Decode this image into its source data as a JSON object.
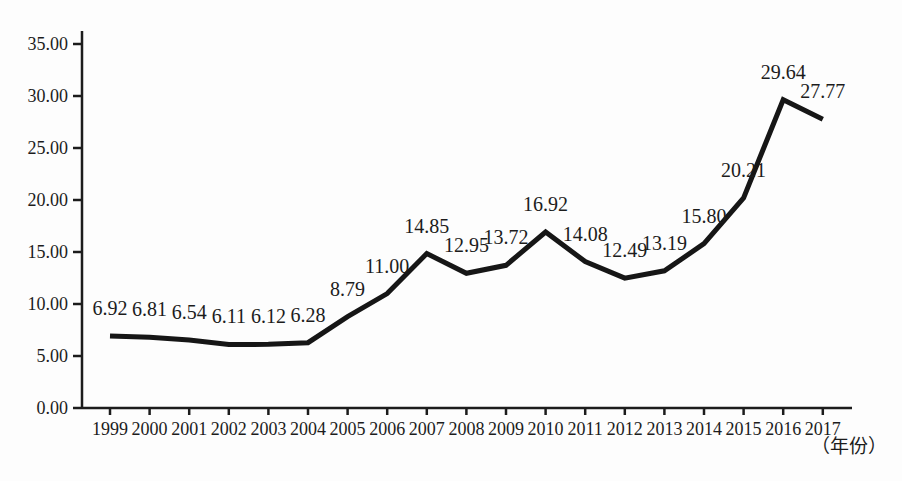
{
  "chart_data": {
    "type": "line",
    "x": [
      1999,
      2000,
      2001,
      2002,
      2003,
      2004,
      2005,
      2006,
      2007,
      2008,
      2009,
      2010,
      2011,
      2012,
      2013,
      2014,
      2015,
      2016,
      2017
    ],
    "values": [
      6.92,
      6.81,
      6.54,
      6.11,
      6.12,
      6.28,
      8.79,
      11.0,
      14.85,
      12.95,
      13.72,
      16.92,
      14.08,
      12.49,
      13.19,
      15.8,
      20.21,
      29.64,
      27.77
    ],
    "labels": [
      "6.92",
      "6.81",
      "6.54",
      "6.11",
      "6.12",
      "6.28",
      "8.79",
      "11.00",
      "14.85",
      "12.95",
      "13.72",
      "16.92",
      "14.08",
      "12.49",
      "13.19",
      "15.80",
      "20.21",
      "29.64",
      "27.77"
    ],
    "title": "",
    "xlabel": "（年份）",
    "ylabel": "",
    "ylim": [
      0,
      35
    ],
    "ytick_step": 5,
    "ytick_labels": [
      "0.00",
      "5.00",
      "10.00",
      "15.00",
      "20.00",
      "25.00",
      "30.00",
      "35.00"
    ],
    "grid": false,
    "legend": null,
    "line_color": "#161616",
    "line_width": 5,
    "text_color": "#1c1c1c"
  }
}
